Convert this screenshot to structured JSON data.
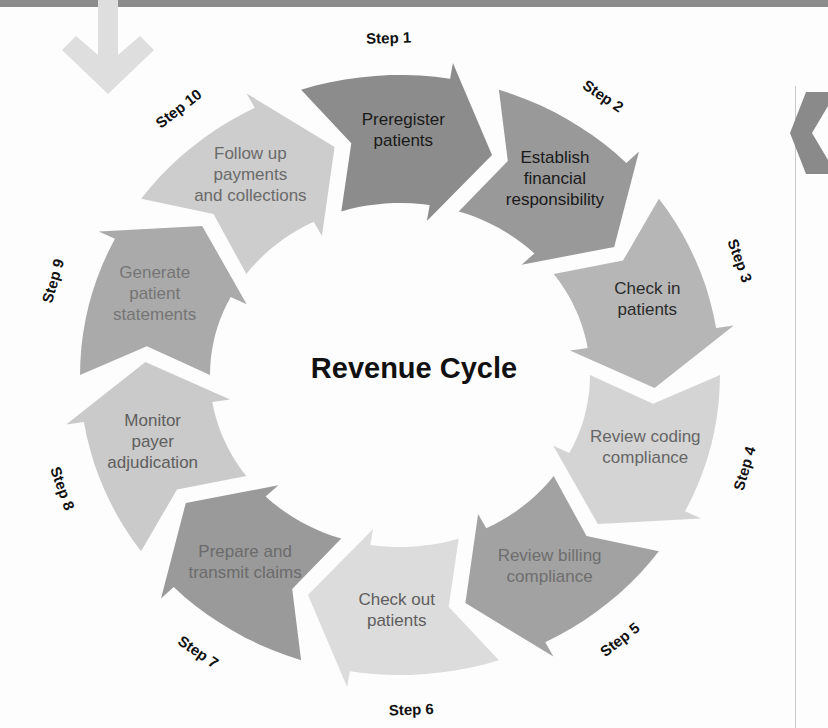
{
  "figure": {
    "center_title": "Revenue Cycle",
    "top_arrow_icon": "down-arrow-icon",
    "right_arrow_icon": "right-chevron-icon"
  },
  "chart_data": {
    "type": "diagram",
    "title": "Revenue Cycle",
    "shape": "circular-cycle",
    "direction": "clockwise",
    "segment_count": 10,
    "segments": [
      {
        "step": "Step 1",
        "label": "Preregister patients",
        "color": "#8c8c8c",
        "text_color": "#1a1a1a"
      },
      {
        "step": "Step 2",
        "label": "Establish financial responsibility",
        "color": "#999999",
        "text_color": "#1a1a1a"
      },
      {
        "step": "Step 3",
        "label": "Check in patients",
        "color": "#b6b6b6",
        "text_color": "#2b2b2b"
      },
      {
        "step": "Step 4",
        "label": "Review coding compliance",
        "color": "#d4d4d4",
        "text_color": "#666666"
      },
      {
        "step": "Step 5",
        "label": "Review billing compliance",
        "color": "#a2a2a2",
        "text_color": "#6e6e6e"
      },
      {
        "step": "Step 6",
        "label": "Check out patients",
        "color": "#dcdcdc",
        "text_color": "#5e5e5e"
      },
      {
        "step": "Step 7",
        "label": "Prepare and transmit claims",
        "color": "#9a9a9a",
        "text_color": "#6b6b6b"
      },
      {
        "step": "Step 8",
        "label": "Monitor payer adjudication",
        "color": "#cacaca",
        "text_color": "#5e5e5e"
      },
      {
        "step": "Step 9",
        "label": "Generate patient statements",
        "color": "#aaaaaa",
        "text_color": "#757575"
      },
      {
        "step": "Step 10",
        "label": "Follow up payments and collections",
        "color": "#cdcdcd",
        "text_color": "#6a6a6a"
      }
    ],
    "segment_lines": [
      [
        "Preregister",
        "patients"
      ],
      [
        "Establish",
        "financial",
        "responsibility"
      ],
      [
        "Check in",
        "patients"
      ],
      [
        "Review coding",
        "compliance"
      ],
      [
        "Review billing",
        "compliance"
      ],
      [
        "Check out",
        "patients"
      ],
      [
        "Prepare and",
        "transmit claims"
      ],
      [
        "Monitor",
        "payer",
        "adjudication"
      ],
      [
        "Generate",
        "patient",
        "statements"
      ],
      [
        "Follow up",
        "payments",
        "and collections"
      ]
    ]
  }
}
